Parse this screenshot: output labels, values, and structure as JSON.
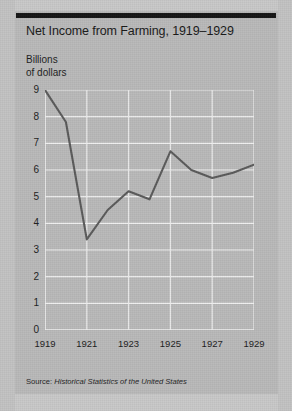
{
  "figure": {
    "title": "Net Income from Farming, 1919–1929",
    "unit_label_line1": "Billions",
    "unit_label_line2": "of dollars",
    "source_prefix": "Source: ",
    "source_title": "Historical Statistics of the United States",
    "colors": {
      "background": "#b9b9b9",
      "rule": "#141414",
      "gridline": "#f0f0f0",
      "data_line": "#5a5a5a",
      "text": "#1c1c1c"
    }
  },
  "chart_data": {
    "type": "line",
    "title": "Net Income from Farming, 1919–1929",
    "xlabel": "",
    "ylabel": "Billions of dollars",
    "x": [
      1919,
      1920,
      1921,
      1922,
      1923,
      1924,
      1925,
      1926,
      1927,
      1928,
      1929
    ],
    "values": [
      9.0,
      7.8,
      3.4,
      4.5,
      5.2,
      4.9,
      6.7,
      6.0,
      5.7,
      5.9,
      6.2
    ],
    "series": [
      {
        "name": "Net income from farming",
        "values": [
          9.0,
          7.8,
          3.4,
          4.5,
          5.2,
          4.9,
          6.7,
          6.0,
          5.7,
          5.9,
          6.2
        ]
      }
    ],
    "xlim": [
      1919,
      1929
    ],
    "ylim": [
      0,
      9
    ],
    "ytick_labels": [
      "9",
      "8",
      "7",
      "6",
      "5",
      "4",
      "3",
      "2",
      "1",
      "0"
    ],
    "ytick_values": [
      9,
      8,
      7,
      6,
      5,
      4,
      3,
      2,
      1,
      0
    ],
    "xtick_labels": [
      "1919",
      "1921",
      "1923",
      "1925",
      "1927",
      "1929"
    ],
    "xtick_values": [
      1919,
      1921,
      1923,
      1925,
      1927,
      1929
    ],
    "grid": true,
    "legend": "none"
  }
}
